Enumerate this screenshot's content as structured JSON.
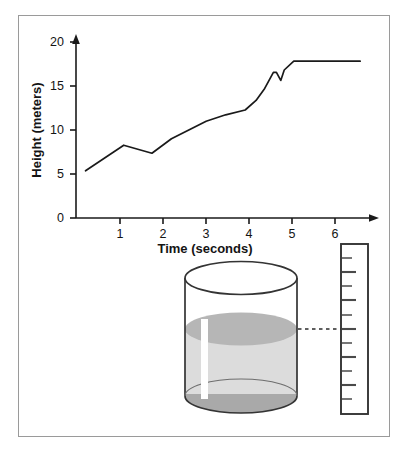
{
  "figure": {
    "caption": "",
    "frame_color": "#9a9a9a",
    "background": "#ffffff"
  },
  "chart_data": {
    "type": "line",
    "title": "",
    "xlabel": "Time (seconds)",
    "ylabel": "Height (meters)",
    "xlim": [
      0,
      6.8
    ],
    "ylim": [
      0,
      22
    ],
    "xticks": [
      "1",
      "2",
      "3",
      "4",
      "5",
      "6"
    ],
    "xtick_values": [
      1,
      2,
      3,
      4,
      5,
      6
    ],
    "yticks": [
      "0",
      "5",
      "10",
      "15",
      "20"
    ],
    "ytick_values": [
      0,
      5,
      10,
      15,
      20
    ],
    "grid": false,
    "legend": null,
    "line_color": "#1a1a1a",
    "axis_color": "#1a1a1a",
    "series": [
      {
        "name": "Height vs Time",
        "x": [
          0.22,
          1.1,
          1.75,
          2.2,
          2.6,
          3.0,
          3.45,
          3.9,
          4.15,
          4.35,
          4.55,
          4.62,
          4.72,
          4.8,
          5.02,
          6.55
        ],
        "y": [
          5.9,
          9.1,
          8.1,
          9.9,
          11.0,
          12.1,
          12.9,
          13.5,
          14.7,
          16.2,
          18.2,
          18.2,
          17.2,
          18.5,
          19.6,
          19.6
        ]
      }
    ]
  },
  "diagram": {
    "name": "graduated-cylinder-with-ruler",
    "beaker": {
      "label": "cylinder",
      "glass_color": "#3a3a3a",
      "liquid_surface_color": "#b4b4b4",
      "liquid_body_color": "#d8d8d8",
      "base_color": "#a8a8a8"
    },
    "ruler": {
      "label": "measuring-scale",
      "border_color": "#3a3a3a",
      "tick_color": "#4a4a4a",
      "tick_count": 12,
      "major_tick_indices": [
        1,
        3,
        5,
        7,
        9,
        11
      ]
    },
    "connector": {
      "label": "measurement-dashed-line",
      "color": "#2a2a2a",
      "style": "dashed"
    }
  }
}
